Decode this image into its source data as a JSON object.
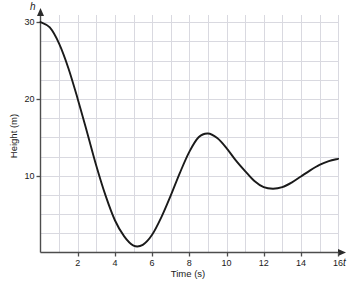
{
  "chart_data": {
    "type": "line",
    "title": "",
    "xlabel": "Time (s)",
    "ylabel": "Height (m)",
    "x_symbol": "t",
    "y_symbol": "h",
    "xlim": [
      0,
      16.4
    ],
    "ylim": [
      0,
      31.5
    ],
    "grid": true,
    "grid_color": "#d9d9e0",
    "grid_step_x": 1,
    "grid_step_y": 2.5,
    "axis_color": "#4d4d4d",
    "line_color": "#1a1a1a",
    "legend": "none",
    "xticks": [
      2,
      4,
      6,
      8,
      10,
      12,
      14,
      16
    ],
    "xtick_labels": [
      "2",
      "4",
      "6",
      "8",
      "10",
      "12",
      "14",
      "16"
    ],
    "yticks": [
      10,
      20,
      30
    ],
    "ytick_labels": [
      "10",
      "20",
      "30"
    ],
    "series": [
      {
        "name": "height",
        "x": [
          0,
          0.5,
          1,
          1.5,
          2,
          2.5,
          3,
          3.5,
          4,
          4.5,
          5,
          5.5,
          6,
          6.5,
          7,
          7.5,
          8,
          8.5,
          9,
          9.5,
          10,
          10.5,
          11,
          11.5,
          12,
          12.5,
          13,
          13.5,
          14,
          14.5,
          15,
          15.5,
          16
        ],
        "y": [
          30.0,
          29.3,
          27.2,
          24.0,
          20.0,
          15.7,
          11.3,
          7.4,
          4.2,
          2.1,
          0.9,
          1.0,
          2.3,
          4.6,
          7.4,
          10.4,
          13.1,
          15.0,
          15.5,
          14.9,
          13.6,
          12.0,
          10.6,
          9.3,
          8.5,
          8.3,
          8.5,
          9.1,
          9.9,
          10.7,
          11.4,
          11.9,
          12.2
        ],
        "start_point": {
          "t": 0,
          "h": 30
        },
        "first_minimum": {
          "t": 4,
          "h": 0.8
        },
        "peak": {
          "t": 9,
          "h": 15.5
        },
        "second_minimum": {
          "t": 12.5,
          "h": 8.3
        },
        "end_point": {
          "t": 16,
          "h": 12.2
        }
      }
    ]
  }
}
